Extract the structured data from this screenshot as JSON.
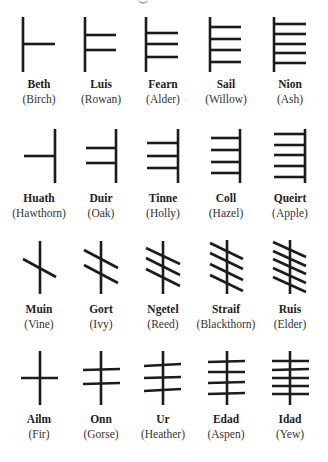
{
  "figure": {
    "title_fragment": "",
    "stroke_color": "#1c1c1c",
    "stroke_width": 2.6,
    "label_color": "#222222"
  },
  "rows": [
    {
      "group": "B-group (strokes right of stem)",
      "label_y": {
        "name": 78,
        "tree": 93
      },
      "letters": [
        {
          "name": "Beth",
          "tree": "(Birch)",
          "cx": 39,
          "stem": [
            23,
            17,
            23,
            72
          ],
          "strokes": [
            [
              23,
              44,
              55,
              44
            ]
          ]
        },
        {
          "name": "Luis",
          "tree": "(Rowan)",
          "cx": 101,
          "stem": [
            85,
            17,
            85,
            72
          ],
          "strokes": [
            [
              85,
              35,
              116,
              35
            ],
            [
              85,
              50,
              116,
              50
            ]
          ]
        },
        {
          "name": "Fearn",
          "tree": "(Alder)",
          "cx": 163,
          "stem": [
            146,
            17,
            146,
            72
          ],
          "strokes": [
            [
              146,
              33,
              178,
              33
            ],
            [
              146,
              44,
              178,
              44
            ],
            [
              146,
              57,
              178,
              57
            ]
          ]
        },
        {
          "name": "Sail",
          "tree": "(Willow)",
          "cx": 226,
          "stem": [
            210,
            17,
            210,
            72
          ],
          "strokes": [
            [
              210,
              27,
              241,
              27
            ],
            [
              210,
              39,
              241,
              39
            ],
            [
              210,
              50,
              241,
              50
            ],
            [
              210,
              62,
              241,
              62
            ]
          ]
        },
        {
          "name": "Nion",
          "tree": "(Ash)",
          "cx": 290,
          "stem": [
            274,
            17,
            274,
            72
          ],
          "strokes": [
            [
              274,
              24,
              306,
              24
            ],
            [
              274,
              34,
              306,
              34
            ],
            [
              274,
              44,
              306,
              44
            ],
            [
              274,
              53,
              306,
              53
            ],
            [
              274,
              63,
              306,
              63
            ]
          ]
        }
      ]
    },
    {
      "group": "H-group (strokes left of stem)",
      "label_y": {
        "name": 192,
        "tree": 207
      },
      "letters": [
        {
          "name": "Huath",
          "tree": "(Hawthorn)",
          "cx": 39,
          "stem": [
            55,
            129,
            55,
            183
          ],
          "strokes": [
            [
              24,
              156,
              55,
              156
            ]
          ]
        },
        {
          "name": "Duir",
          "tree": "(Oak)",
          "cx": 101,
          "stem": [
            116,
            129,
            116,
            183
          ],
          "strokes": [
            [
              86,
              148,
              116,
              148
            ],
            [
              86,
              163,
              116,
              163
            ]
          ]
        },
        {
          "name": "Tinne",
          "tree": "(Holly)",
          "cx": 163,
          "stem": [
            178,
            129,
            178,
            183
          ],
          "strokes": [
            [
              147,
              143,
              178,
              143
            ],
            [
              147,
              156,
              178,
              156
            ],
            [
              147,
              168,
              178,
              168
            ]
          ]
        },
        {
          "name": "Coll",
          "tree": "(Hazel)",
          "cx": 226,
          "stem": [
            240,
            129,
            240,
            183
          ],
          "strokes": [
            [
              211,
              138,
              240,
              138
            ],
            [
              211,
              150,
              240,
              150
            ],
            [
              211,
              162,
              240,
              162
            ],
            [
              211,
              173,
              240,
              173
            ]
          ]
        },
        {
          "name": "Queirt",
          "tree": "(Apple)",
          "cx": 290,
          "stem": [
            305,
            129,
            305,
            183
          ],
          "strokes": [
            [
              274,
              134,
              305,
              134
            ],
            [
              274,
              145,
              305,
              145
            ],
            [
              274,
              155,
              305,
              155
            ],
            [
              274,
              166,
              305,
              166
            ],
            [
              274,
              177,
              305,
              177
            ]
          ]
        }
      ]
    },
    {
      "group": "M-group (diagonal strokes across stem)",
      "label_y": {
        "name": 303,
        "tree": 318
      },
      "letters": [
        {
          "name": "Muin",
          "tree": "(Vine)",
          "cx": 39,
          "stem": [
            40,
            241,
            40,
            294
          ],
          "strokes": [
            [
              23,
              259,
              56,
              277
            ]
          ]
        },
        {
          "name": "Gort",
          "tree": "(Ivy)",
          "cx": 101,
          "stem": [
            101,
            241,
            101,
            294
          ],
          "strokes": [
            [
              84,
              250,
              118,
              268
            ],
            [
              84,
              265,
              118,
              283
            ]
          ]
        },
        {
          "name": "Ngetel",
          "tree": "(Reed)",
          "cx": 163,
          "stem": [
            163,
            241,
            163,
            294
          ],
          "strokes": [
            [
              146,
              248,
              180,
              264
            ],
            [
              146,
              258,
              180,
              275
            ],
            [
              146,
              269,
              180,
              286
            ]
          ]
        },
        {
          "name": "Straif",
          "tree": "(Blackthorn)",
          "cx": 226,
          "stem": [
            227,
            240,
            227,
            294
          ],
          "strokes": [
            [
              210,
              243,
              243,
              259
            ],
            [
              210,
              253,
              243,
              269
            ],
            [
              210,
              264,
              243,
              280
            ],
            [
              210,
              275,
              243,
              291
            ]
          ]
        },
        {
          "name": "Ruis",
          "tree": "(Elder)",
          "cx": 290,
          "stem": [
            290,
            240,
            290,
            294
          ],
          "strokes": [
            [
              273,
              242,
              306,
              257
            ],
            [
              273,
              251,
              306,
              266
            ],
            [
              273,
              259,
              306,
              274
            ],
            [
              273,
              268,
              306,
              283
            ],
            [
              273,
              277,
              306,
              292
            ]
          ]
        }
      ]
    },
    {
      "group": "A-group (strokes across stem)",
      "label_y": {
        "name": 413,
        "tree": 428
      },
      "letters": [
        {
          "name": "Ailm",
          "tree": "(Fir)",
          "cx": 39,
          "stem": [
            40,
            351,
            40,
            405
          ],
          "strokes": [
            [
              21,
              378,
              58,
              378
            ]
          ]
        },
        {
          "name": "Onn",
          "tree": "(Gorse)",
          "cx": 101,
          "stem": [
            101,
            351,
            101,
            405
          ],
          "strokes": [
            [
              83,
              370,
              120,
              369
            ],
            [
              83,
              384,
              120,
              383
            ]
          ]
        },
        {
          "name": "Ur",
          "tree": "(Heather)",
          "cx": 163,
          "stem": [
            163,
            351,
            163,
            405
          ],
          "strokes": [
            [
              144,
              366,
              181,
              364
            ],
            [
              144,
              378,
              181,
              377
            ],
            [
              144,
              391,
              181,
              389
            ]
          ]
        },
        {
          "name": "Edad",
          "tree": "(Aspen)",
          "cx": 226,
          "stem": [
            227,
            351,
            227,
            405
          ],
          "strokes": [
            [
              208,
              362,
              245,
              361
            ],
            [
              208,
              372,
              245,
              372
            ],
            [
              208,
              383,
              245,
              382
            ],
            [
              208,
              394,
              245,
              393
            ]
          ]
        },
        {
          "name": "Idad",
          "tree": "(Yew)",
          "cx": 290,
          "stem": [
            290,
            351,
            290,
            405
          ],
          "strokes": [
            [
              272,
              361,
              309,
              361
            ],
            [
              272,
              370,
              309,
              369
            ],
            [
              272,
              378,
              309,
              378
            ],
            [
              272,
              386,
              309,
              386
            ],
            [
              272,
              394,
              309,
              394
            ]
          ]
        }
      ]
    }
  ]
}
